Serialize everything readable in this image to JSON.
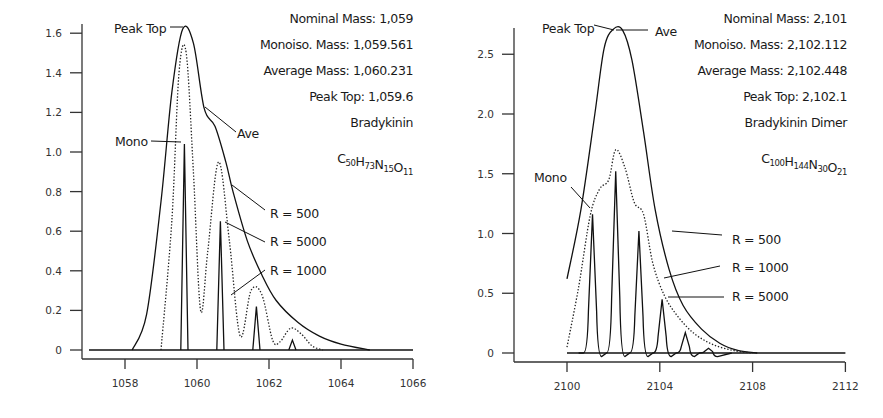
{
  "chart_data": [
    {
      "type": "line",
      "title": "Bradykinin",
      "formula": {
        "parts": [
          [
            "C",
            "50"
          ],
          [
            "H",
            "73"
          ],
          [
            "N",
            "15"
          ],
          [
            "O",
            "11"
          ]
        ]
      },
      "info": [
        "Nominal Mass: 1,059",
        "Monoiso. Mass: 1,059.561",
        "Average Mass: 1,060.231",
        "Peak Top: 1,059.6",
        "Bradykinin"
      ],
      "xlabel": "",
      "ylabel": "",
      "xlim": [
        1057,
        1066
      ],
      "ylim": [
        0,
        1.65
      ],
      "x_ticks": [
        "1058",
        "1060",
        "1062",
        "1064",
        "1066"
      ],
      "y_ticks": [
        "0",
        "0.2",
        "0.4",
        "0.6",
        "0.8",
        "1.0",
        "1.2",
        "1.4",
        "1.6"
      ],
      "grid": false,
      "annotations": [
        "Peak Top",
        "Mono",
        "Ave",
        "R = 500",
        "R = 5000",
        "R = 1000"
      ],
      "series": [
        {
          "name": "R = 500",
          "style": "solid",
          "x": [
            1058.2,
            1058.6,
            1059.0,
            1059.3,
            1059.6,
            1059.9,
            1060.2,
            1060.5,
            1060.8,
            1061.0,
            1061.4,
            1061.8,
            1062.2,
            1062.8,
            1063.4,
            1064.0,
            1064.8
          ],
          "y": [
            0,
            0.18,
            0.75,
            1.3,
            1.62,
            1.55,
            1.22,
            1.13,
            0.95,
            0.8,
            0.55,
            0.38,
            0.25,
            0.14,
            0.07,
            0.03,
            0
          ]
        },
        {
          "name": "R = 1000",
          "style": "dotted",
          "x": [
            1059.0,
            1059.3,
            1059.5,
            1059.7,
            1059.9,
            1060.1,
            1060.3,
            1060.6,
            1060.9,
            1061.2,
            1061.5,
            1061.8,
            1062.1,
            1062.3,
            1062.6,
            1062.9,
            1063.2,
            1063.5
          ],
          "y": [
            0,
            0.65,
            1.4,
            1.5,
            0.9,
            0.2,
            0.5,
            0.95,
            0.55,
            0.07,
            0.3,
            0.28,
            0.05,
            0.04,
            0.11,
            0.08,
            0.02,
            0
          ]
        },
        {
          "name": "R = 5000",
          "style": "solid",
          "x": [
            1059.55,
            1059.65,
            1059.75,
            1060.55,
            1060.65,
            1060.75,
            1061.55,
            1061.65,
            1061.75,
            1062.55,
            1062.65,
            1062.75
          ],
          "y": [
            0,
            1.04,
            0,
            0,
            0.65,
            0,
            0,
            0.22,
            0,
            0,
            0.05,
            0
          ]
        }
      ]
    },
    {
      "type": "line",
      "title": "Bradykinin Dimer",
      "formula": {
        "parts": [
          [
            "C",
            "100"
          ],
          [
            "H",
            "144"
          ],
          [
            "N",
            "30"
          ],
          [
            "O",
            "21"
          ]
        ]
      },
      "info": [
        "Nominal Mass: 2,101",
        "Monoiso. Mass: 2,102.112",
        "Average Mass: 2,102.448",
        "Peak Top: 2,102.1",
        "Bradykinin Dimer"
      ],
      "xlabel": "",
      "ylabel": "",
      "xlim": [
        2098,
        2112
      ],
      "ylim": [
        0,
        2.75
      ],
      "x_ticks": [
        "2100",
        "2104",
        "2108",
        "2112"
      ],
      "y_ticks": [
        "0",
        "0.5",
        "1.0",
        "1.5",
        "2.0",
        "2.5"
      ],
      "grid": false,
      "annotations": [
        "Peak Top",
        "Ave",
        "Mono",
        "R = 500",
        "R = 1000",
        "R = 5000"
      ],
      "series": [
        {
          "name": "R = 500",
          "style": "solid",
          "x": [
            2100.0,
            2100.6,
            2101.2,
            2101.6,
            2102.0,
            2102.4,
            2102.8,
            2103.3,
            2103.8,
            2104.4,
            2105.0,
            2105.8,
            2106.6,
            2107.4,
            2108.2
          ],
          "y": [
            0.62,
            1.2,
            2.0,
            2.55,
            2.71,
            2.7,
            2.45,
            1.85,
            1.2,
            0.7,
            0.4,
            0.2,
            0.08,
            0.02,
            0
          ]
        },
        {
          "name": "R = 1000",
          "style": "dotted",
          "x": [
            2100.0,
            2100.5,
            2101.0,
            2101.4,
            2101.8,
            2102.1,
            2102.5,
            2102.9,
            2103.3,
            2103.7,
            2104.2,
            2104.8,
            2105.5,
            2106.3,
            2107.2,
            2108.0
          ],
          "y": [
            0.05,
            0.55,
            1.15,
            1.37,
            1.45,
            1.7,
            1.55,
            1.26,
            1.16,
            0.75,
            0.48,
            0.3,
            0.16,
            0.07,
            0.02,
            0
          ]
        },
        {
          "name": "R = 5000",
          "style": "solid",
          "peaks_x": [
            2101.1,
            2102.1,
            2103.1,
            2104.1,
            2105.1,
            2106.1
          ],
          "peaks_y": [
            1.16,
            1.52,
            1.02,
            0.45,
            0.17,
            0.04
          ]
        }
      ]
    }
  ]
}
